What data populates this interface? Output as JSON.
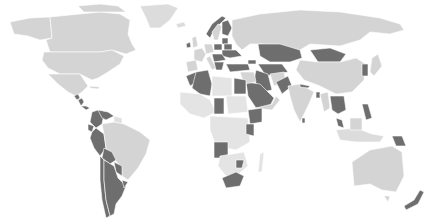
{
  "map": {
    "type": "choropleth",
    "projection": "world",
    "background": "#ffffff",
    "border_color": "#ffffff",
    "colors": {
      "base": "#d4d4d4",
      "light": "#e4e4e4",
      "highlight": "#6e6e6e"
    },
    "highlighted_regions": [
      "Guatemala",
      "Honduras",
      "Nicaragua",
      "Costa Rica",
      "Panama",
      "Colombia",
      "Venezuela",
      "Ecuador",
      "Peru",
      "Bolivia",
      "Chile",
      "Argentina",
      "Paraguay",
      "Uruguay",
      "Ireland",
      "Norway",
      "Finland",
      "Poland",
      "Ukraine",
      "Belarus",
      "Lithuania",
      "Latvia",
      "Romania",
      "Hungary",
      "Serbia",
      "Bulgaria",
      "Greece",
      "Turkey",
      "Georgia",
      "Morocco",
      "Algeria",
      "Egypt",
      "Saudi Arabia",
      "Iran",
      "Uzbekistan",
      "Turkmenistan",
      "Kazakhstan",
      "Mongolia",
      "Pakistan",
      "Nepal",
      "Bangladesh",
      "South Korea",
      "Thailand",
      "Vietnam",
      "Malaysia",
      "Philippines",
      "Papua New Guinea",
      "New Zealand",
      "Chad",
      "Sudan",
      "Ethiopia",
      "Kenya",
      "Angola",
      "Zimbabwe",
      "South Africa"
    ]
  }
}
